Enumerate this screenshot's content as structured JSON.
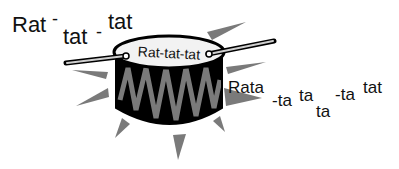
{
  "illustration": {
    "subject": "drum-with-drumsticks",
    "colors": {
      "drum_body": "#000000",
      "zigzag": "#7a7a7a",
      "drum_head": "#f2f2f2",
      "rays": "#7a7a7a",
      "text": "#111111",
      "background": "#ffffff"
    },
    "texts": {
      "left": {
        "part1": "Rat",
        "part2": "-",
        "part3": "tat",
        "part4": "-",
        "part5": "tat"
      },
      "drum_head": "Rat-tat-tat",
      "right": {
        "part1": "Rata",
        "part2": "-ta",
        "part3": "ta",
        "part4": "ta",
        "part5": "-ta",
        "part6": "tat"
      }
    }
  }
}
